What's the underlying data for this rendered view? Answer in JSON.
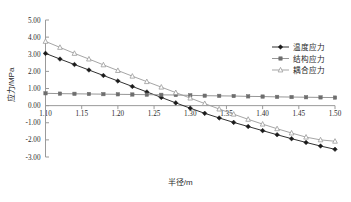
{
  "chart_data": {
    "type": "line",
    "title": "",
    "xlabel": "半径/m",
    "ylabel": "应力/MPa",
    "xlim": [
      1.1,
      1.5
    ],
    "ylim": [
      -3.0,
      5.0
    ],
    "xticks": [
      1.1,
      1.15,
      1.2,
      1.25,
      1.3,
      1.35,
      1.4,
      1.45,
      1.5
    ],
    "xtick_labels": [
      "1.10",
      "1.15",
      "1.20",
      "1.25",
      "1.30",
      "1.35",
      "1.40",
      "1.45",
      "1.50"
    ],
    "yticks": [
      -3.0,
      -2.0,
      -1.0,
      0.0,
      1.0,
      2.0,
      3.0,
      4.0,
      5.0
    ],
    "ytick_labels": [
      "-3.00",
      "-2.00",
      "-1.00",
      "0.00",
      "1.00",
      "2.00",
      "3.00",
      "4.00",
      "5.00"
    ],
    "grid": false,
    "legend_position": "upper right",
    "x": [
      1.1,
      1.12,
      1.14,
      1.16,
      1.18,
      1.2,
      1.22,
      1.24,
      1.26,
      1.28,
      1.3,
      1.32,
      1.34,
      1.36,
      1.38,
      1.4,
      1.42,
      1.44,
      1.46,
      1.48,
      1.5
    ],
    "series": [
      {
        "name": "温度应力",
        "marker": "diamond",
        "color": "#1a1a1a",
        "line_color": "#1a1a1a",
        "values": [
          3.05,
          2.72,
          2.4,
          2.08,
          1.76,
          1.44,
          1.12,
          0.8,
          0.48,
          0.16,
          -0.15,
          -0.45,
          -0.72,
          -0.98,
          -1.22,
          -1.46,
          -1.7,
          -1.93,
          -2.15,
          -2.36,
          -2.55
        ]
      },
      {
        "name": "结构应力",
        "marker": "square",
        "color": "#6e6e6e",
        "line_color": "#8a8a8a",
        "values": [
          0.72,
          0.7,
          0.69,
          0.68,
          0.67,
          0.66,
          0.65,
          0.64,
          0.63,
          0.62,
          0.6,
          0.58,
          0.57,
          0.56,
          0.54,
          0.53,
          0.51,
          0.5,
          0.49,
          0.48,
          0.47
        ]
      },
      {
        "name": "耦合应力",
        "marker": "triangle-open",
        "color": "#9b9b9b",
        "line_color": "#9b9b9b",
        "values": [
          3.75,
          3.4,
          3.05,
          2.72,
          2.38,
          2.05,
          1.72,
          1.4,
          1.08,
          0.76,
          0.44,
          0.12,
          -0.2,
          -0.5,
          -0.8,
          -1.08,
          -1.35,
          -1.6,
          -1.84,
          -2.0,
          -2.08
        ]
      }
    ]
  },
  "legend": {
    "items": [
      {
        "label": "温度应力"
      },
      {
        "label": "结构应力"
      },
      {
        "label": "耦合应力"
      }
    ]
  },
  "axes": {
    "x_title": "半径/m",
    "y_title": "应力/MPa"
  }
}
